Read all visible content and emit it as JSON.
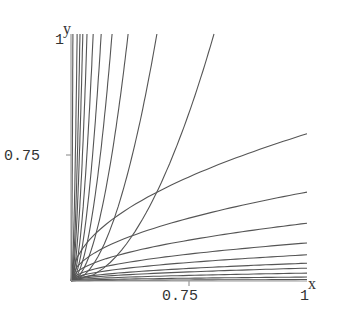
{
  "chart_data": {
    "type": "contour",
    "title": "",
    "xlabel": "x",
    "ylabel": "y",
    "xlim": [
      0.5,
      1.0
    ],
    "ylim": [
      0.5,
      1.0
    ],
    "grid": false,
    "x_ticks": [
      {
        "value": 0.75,
        "label": "0.75"
      },
      {
        "value": 1.0,
        "label": "1"
      }
    ],
    "y_ticks": [
      {
        "value": 0.75,
        "label": "0.75"
      },
      {
        "value": 1.0,
        "label": "1"
      }
    ],
    "contours_upper_top_x": [
      0.504,
      0.513,
      0.519,
      0.525,
      0.534,
      0.547,
      0.564,
      0.587,
      0.621,
      0.682,
      0.803
    ],
    "contours_right_end_y": [
      0.798,
      0.68,
      0.617,
      0.577,
      0.553,
      0.536,
      0.526,
      0.516,
      0.508,
      0.503
    ],
    "contour_shape_exponent": 0.5,
    "line_color": "#555555",
    "axis_color": "#999999"
  },
  "axes": {
    "x_label": "x",
    "y_label": "y",
    "x_tick_075": "0.75",
    "x_tick_1": "1",
    "y_tick_075": "0.75",
    "y_tick_1": "1"
  }
}
